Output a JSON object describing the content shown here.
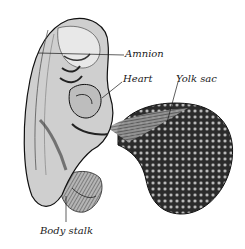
{
  "figure": {
    "labels": {
      "amnion": "Amnion",
      "heart": "Heart",
      "yolk_sac": "Yolk sac",
      "body_stalk": "Body stalk"
    },
    "colors": {
      "background": "#ffffff",
      "ink": "#1a1a1a",
      "shade_dark": "#2b2b2b",
      "shade_mid": "#6b6b6b",
      "shade_light": "#c8c8c8"
    }
  }
}
